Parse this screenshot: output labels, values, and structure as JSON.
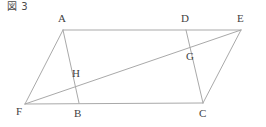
{
  "figure": {
    "caption": "図 3",
    "type": "geometry-diagram",
    "canvas": {
      "width": 266,
      "height": 127
    },
    "style": {
      "background": "#ffffff",
      "stroke_color": "#a9a9a9",
      "stroke_width": 1,
      "label_color": "#3f3f3f"
    },
    "points": [
      {
        "id": "A",
        "label": "A",
        "x": 63,
        "y": 30,
        "label_x": 58,
        "label_y": 13
      },
      {
        "id": "B",
        "label": "B",
        "x": 79,
        "y": 103,
        "label_x": 74,
        "label_y": 108
      },
      {
        "id": "C",
        "label": "C",
        "x": 203,
        "y": 103,
        "label_x": 199,
        "label_y": 108
      },
      {
        "id": "D",
        "label": "D",
        "x": 186,
        "y": 30,
        "label_x": 181,
        "label_y": 13
      },
      {
        "id": "E",
        "label": "E",
        "x": 241,
        "y": 30,
        "label_x": 237,
        "label_y": 13
      },
      {
        "id": "F",
        "label": "F",
        "x": 25,
        "y": 104,
        "label_x": 16,
        "label_y": 106
      },
      {
        "id": "G",
        "label": "G",
        "x": 192,
        "y": 50,
        "label_x": 186,
        "label_y": 51
      },
      {
        "id": "H",
        "label": "H",
        "x": 77,
        "y": 82,
        "label_x": 72,
        "label_y": 68
      }
    ],
    "segments": [
      {
        "id": "AE",
        "from": "A",
        "to": "E",
        "name": "top-edge-a-to-e"
      },
      {
        "id": "FC",
        "from": "F",
        "to": "C",
        "name": "bottom-edge-f-to-c"
      },
      {
        "id": "AF",
        "from": "A",
        "to": "F",
        "name": "side-a-to-f"
      },
      {
        "id": "AB",
        "from": "A",
        "to": "B",
        "name": "segment-a-to-b"
      },
      {
        "id": "FE",
        "from": "F",
        "to": "E",
        "name": "diagonal-f-to-e"
      },
      {
        "id": "DC",
        "from": "D",
        "to": "C",
        "name": "segment-d-to-c"
      },
      {
        "id": "EC",
        "from": "E",
        "to": "C",
        "name": "side-e-to-c"
      }
    ],
    "intersections": [
      {
        "id": "H",
        "of": [
          "AB",
          "FE"
        ]
      },
      {
        "id": "G",
        "of": [
          "DC",
          "FE"
        ]
      }
    ]
  }
}
